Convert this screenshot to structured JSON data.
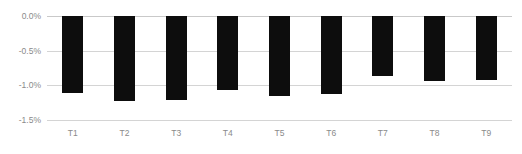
{
  "chart_data": {
    "type": "bar",
    "title": "",
    "subtitle": "",
    "xlabel": "",
    "ylabel": "",
    "categories": [
      "T1",
      "T2",
      "T3",
      "T4",
      "T5",
      "T6",
      "T7",
      "T8",
      "T9"
    ],
    "values": [
      -1.11,
      -1.23,
      -1.21,
      -1.07,
      -1.15,
      -1.13,
      -0.87,
      -0.94,
      -0.92
    ],
    "series": [
      {
        "name": "",
        "values": [
          -1.11,
          -1.23,
          -1.21,
          -1.07,
          -1.15,
          -1.13,
          -0.87,
          -0.94,
          -0.92
        ]
      }
    ],
    "ylim": [
      -1.5,
      0.0
    ],
    "y_ticks": [
      0.0,
      -0.5,
      -1.0,
      -1.5
    ],
    "y_tick_labels": [
      "0.0%",
      "-0.5%",
      "-1.0%",
      "-1.5%"
    ],
    "grid": true,
    "grid_axis": "y",
    "legend": false,
    "legend_position": "none",
    "orientation": "vertical",
    "bar_color": "#0d0d0d",
    "grid_color": "#d4d4d4",
    "tick_label_color": "#8a8a8a",
    "background_color": "#ffffff",
    "annotations": []
  }
}
